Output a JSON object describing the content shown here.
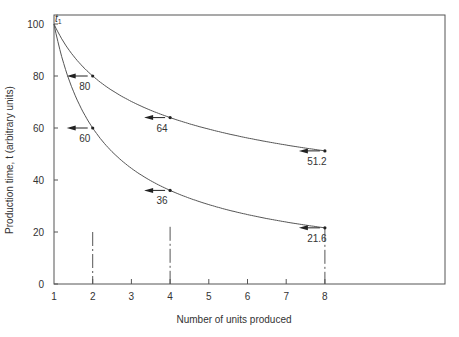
{
  "chart_data": {
    "type": "line",
    "title": "",
    "xlabel": "Number of units produced",
    "ylabel": "Production time, t (arbitrary units)",
    "xlim": [
      1,
      10
    ],
    "ylim": [
      0,
      100
    ],
    "x_ticks": [
      1,
      2,
      3,
      4,
      5,
      6,
      7,
      8
    ],
    "y_ticks": [
      0,
      20,
      40,
      60,
      80,
      100
    ],
    "grid": false,
    "origin_label": "t1",
    "series": [
      {
        "name": "80% learning curve",
        "rate": 0.8,
        "points": [
          {
            "x": 1,
            "y": 100
          },
          {
            "x": 2,
            "y": 80,
            "label": "80"
          },
          {
            "x": 4,
            "y": 64,
            "label": "64"
          },
          {
            "x": 8,
            "y": 51.2,
            "label": "51.2"
          }
        ]
      },
      {
        "name": "60% learning curve",
        "rate": 0.6,
        "points": [
          {
            "x": 1,
            "y": 100
          },
          {
            "x": 2,
            "y": 60,
            "label": "60"
          },
          {
            "x": 4,
            "y": 36,
            "label": "36"
          },
          {
            "x": 8,
            "y": 21.6,
            "label": "21.6"
          }
        ]
      }
    ],
    "reference_lines": [
      {
        "x": 2,
        "style": "dash-dot",
        "from_y": 20
      },
      {
        "x": 4,
        "style": "dash-dot",
        "from_y": 22
      },
      {
        "x": 8,
        "style": "dash-dot",
        "from_y": 21.6
      }
    ]
  },
  "colors": {
    "axis": "#555555",
    "curve": "#555555",
    "text": "#333333"
  }
}
